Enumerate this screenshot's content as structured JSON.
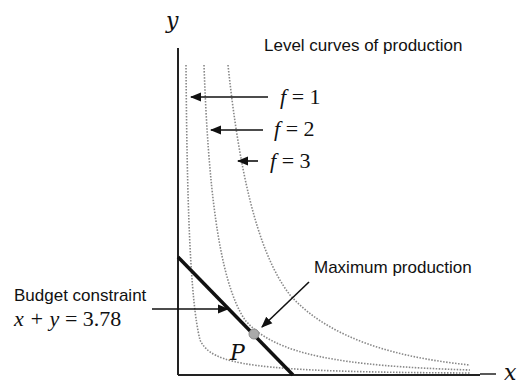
{
  "diagram": {
    "title": "Level curves of production",
    "axes": {
      "x_label": "x",
      "y_label": "y"
    },
    "level_curves": [
      {
        "label_var": "f",
        "label_eq": "=",
        "label_val": "1"
      },
      {
        "label_var": "f",
        "label_eq": "=",
        "label_val": "2"
      },
      {
        "label_var": "f",
        "label_eq": "=",
        "label_val": "3"
      }
    ],
    "budget_constraint": {
      "label": "Budget constraint",
      "equation_lhs": "x + y",
      "equation_eq": "=",
      "equation_rhs": "3.78"
    },
    "maximum": {
      "label": "Maximum production",
      "point_label": "P"
    },
    "colors": {
      "axis": "#222222",
      "curve": "#888888",
      "budget_line": "#111111",
      "point": "#999999"
    }
  }
}
